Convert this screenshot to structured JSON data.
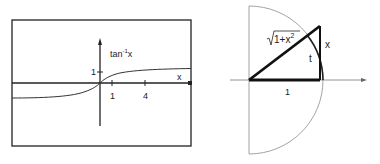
{
  "left_figure": {
    "function_label": "tan",
    "function_superscript": "-1",
    "function_var": "x",
    "x_axis_label": "x",
    "y_tick_label": "1",
    "x_tick_labels": [
      "1",
      "4"
    ]
  },
  "right_figure": {
    "hypotenuse_label_radicand": "1+x",
    "hypotenuse_label_exp": "2",
    "opposite_label": "x",
    "adjacent_label": "1",
    "angle_label": "t"
  },
  "colors": {
    "line": "#222222",
    "arc": "#999999"
  }
}
